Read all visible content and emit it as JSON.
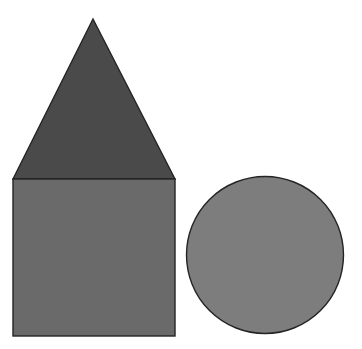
{
  "canvas": {
    "width": 362,
    "height": 349,
    "background_color": "#ffffff",
    "title": "Geometric shapes: house (triangle over square) and circle"
  },
  "palette": {
    "triangle_fill": "#4a4a4a",
    "square_fill": "#6a6a6a",
    "circle_fill": "#7d7d7d",
    "outline": "#242424",
    "background": "#ffffff"
  },
  "shapes": [
    {
      "id": "triangle",
      "name": "triangle",
      "label": "Triangle",
      "fill_color": "#4a4a4a",
      "stroke_color": "#242424",
      "stroke_width": 1.4,
      "points": "93,19 175,179 13,179",
      "apex_x": 93,
      "apex_y": 19,
      "base_left_x": 13,
      "base_right_x": 175,
      "base_y": 179,
      "base_width": 162,
      "height": 160
    },
    {
      "id": "square",
      "name": "square",
      "label": "Square",
      "fill_color": "#6a6a6a",
      "stroke_color": "#242424",
      "stroke_width": 1.4,
      "x": 13,
      "y": 179,
      "width": 162,
      "height": 157
    },
    {
      "id": "circle",
      "name": "circle",
      "label": "Circle",
      "fill_color": "#7d7d7d",
      "stroke_color": "#242424",
      "stroke_width": 1.4,
      "center_x": 265,
      "center_y": 255,
      "radius": 78.5,
      "diameter": 157
    }
  ]
}
